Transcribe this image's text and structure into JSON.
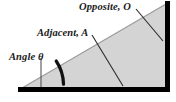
{
  "figure": {
    "kind": "right-triangle-trigonometry-diagram",
    "background_color": "#ffffff",
    "triangle": {
      "fill_color": "#d4d4d4",
      "edge_color": "#000000",
      "hypotenuse_color": "#9a9a9a",
      "vertices": {
        "left_apex": [
          22,
          88
        ],
        "right_angle_corner": [
          166,
          88
        ],
        "top_apex": [
          166,
          4
        ]
      }
    },
    "angle_arc": {
      "color": "#111111",
      "center": [
        22,
        88
      ],
      "radius": 43
    }
  },
  "labels": {
    "opposite": "Opposite, O",
    "adjacent": "Adjacent, A",
    "angle": "Angle θ"
  },
  "leaders": {
    "opposite_leader": {
      "from": [
        136,
        9
      ],
      "to": [
        163,
        41
      ],
      "color": "#2b2b2b"
    },
    "adjacent_leader": {
      "from": [
        92,
        35
      ],
      "to": [
        123,
        86
      ],
      "color": "#2b2b2b"
    },
    "angle_leader": {
      "from": [
        41,
        58
      ],
      "to": [
        41,
        87
      ],
      "color": "#555555"
    }
  }
}
